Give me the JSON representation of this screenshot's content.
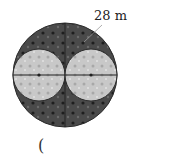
{
  "figure": {
    "dimension_label": "28 m",
    "answer_paren": "(",
    "colors": {
      "outer_fill": "#4a4a4a",
      "inner_fill": "#c8c8c8",
      "stroke": "#2a2a2a",
      "background": "#ffffff"
    },
    "outer_circle": {
      "cx": 65,
      "cy": 75,
      "r": 52
    },
    "inner_circles": [
      {
        "cx": 39,
        "cy": 75,
        "r": 26
      },
      {
        "cx": 91,
        "cy": 75,
        "r": 26
      }
    ]
  }
}
